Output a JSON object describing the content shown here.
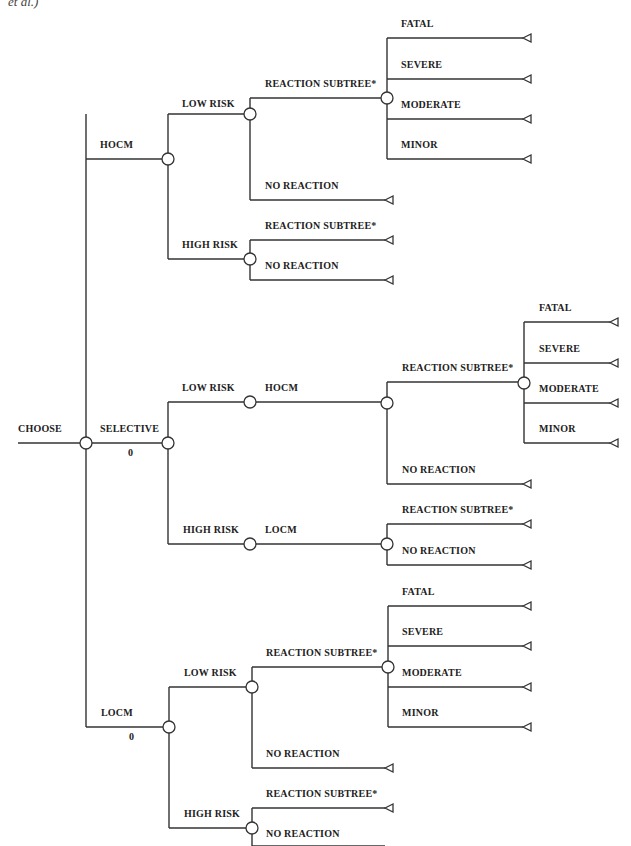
{
  "header_fragment": "et al.)",
  "root": {
    "label": "CHOOSE"
  },
  "strategies": [
    {
      "label": "HOCM",
      "value": ""
    },
    {
      "label": "SELECTIVE",
      "value": "0"
    },
    {
      "label": "LOCM",
      "value": "0"
    }
  ],
  "labels": {
    "low_risk": "LOW RISK",
    "high_risk": "HIGH RISK",
    "reaction_subtree": "REACTION SUBTREE*",
    "no_reaction": "NO REACTION",
    "hocm": "HOCM",
    "locm": "LOCM",
    "fatal": "FATAL",
    "severe": "SEVERE",
    "moderate": "MODERATE",
    "minor": "MINOR"
  },
  "colors": {
    "line": "#333333",
    "text": "#222222"
  }
}
